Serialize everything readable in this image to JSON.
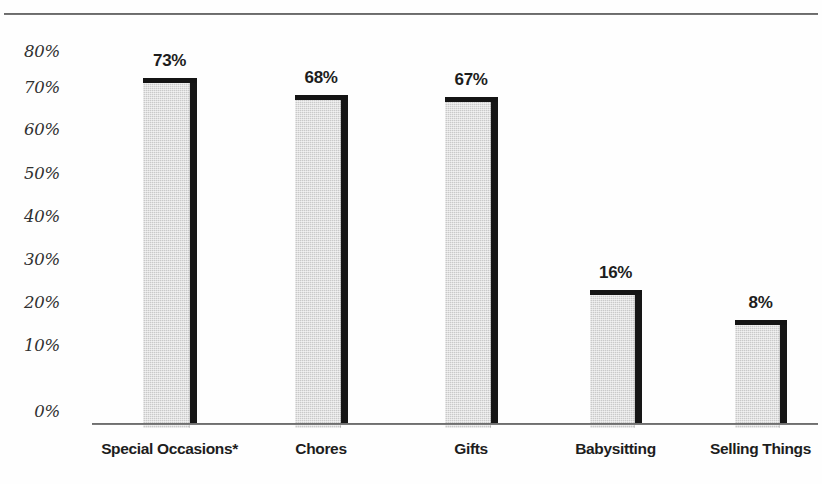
{
  "chart_data": {
    "type": "bar",
    "title": "",
    "subtitle": "",
    "xlabel": "",
    "ylabel": "",
    "categories": [
      "Special Occasions*",
      "Chores",
      "Gifts",
      "Babysitting",
      "Selling Things"
    ],
    "values": [
      73,
      68,
      67,
      16,
      8
    ],
    "value_labels": [
      "73%",
      "68%",
      "67%",
      "16%",
      "8%"
    ],
    "ylim": [
      0,
      80
    ],
    "ytick_values": [
      80,
      70,
      60,
      50,
      40,
      30,
      20,
      10,
      0
    ],
    "ytick_labels": [
      "80%",
      "70%",
      "60%",
      "50%",
      "40%",
      "30%",
      "20%",
      "10%",
      "0%"
    ],
    "grid": false,
    "legend": false,
    "legend_position": "none",
    "bar_fill_color": "#c9c9c9",
    "bar_edge_color": "#161616",
    "axis_color": "#4f4f4f",
    "text_color": "#1d1d1d",
    "annotations": [
      "*"
    ],
    "drawn_bar_top_y": [
      78,
      95,
      97,
      290,
      320
    ],
    "bars": [
      {
        "category": "Special Occasions*",
        "value": 73,
        "label": "73%",
        "left": 143,
        "width": 47,
        "top": 78
      },
      {
        "category": "Chores",
        "value": 68,
        "label": "68%",
        "left": 295,
        "width": 46,
        "top": 95
      },
      {
        "category": "Gifts",
        "value": 67,
        "label": "67%",
        "left": 445,
        "width": 46,
        "top": 97
      },
      {
        "category": "Babysitting",
        "value": 16,
        "label": "16%",
        "left": 590,
        "width": 45,
        "top": 290
      },
      {
        "category": "Selling Things",
        "value": 8,
        "label": "8%",
        "left": 735,
        "width": 45,
        "top": 320
      }
    ]
  },
  "axis": {
    "baseline_left": 92,
    "baseline_right": 818,
    "baseline_y": 423,
    "tick_positions_y": [
      52,
      88,
      130,
      174,
      217,
      260,
      303,
      346,
      412
    ]
  },
  "footer": {
    "clipped_text": ""
  }
}
